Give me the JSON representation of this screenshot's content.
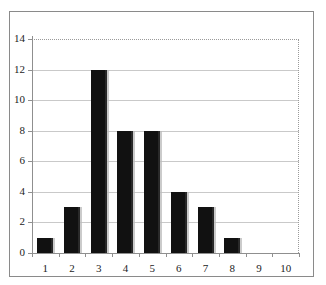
{
  "chart_data": {
    "type": "bar",
    "title": "",
    "subtitle": "",
    "xlabel": "",
    "ylabel": "",
    "categories": [
      "1",
      "2",
      "3",
      "4",
      "5",
      "6",
      "7",
      "8",
      "9",
      "10"
    ],
    "values": [
      1,
      3,
      12,
      8,
      8,
      4,
      3,
      1,
      0,
      0
    ],
    "ylim": [
      0,
      14
    ],
    "ytick_labels": [
      "0",
      "2",
      "4",
      "6",
      "8",
      "10",
      "12",
      "14"
    ],
    "ytick_values": [
      0,
      2,
      4,
      6,
      8,
      10,
      12,
      14
    ],
    "ystep": 2,
    "xtick_labels": [
      "1",
      "2",
      "3",
      "4",
      "5",
      "6",
      "7",
      "8",
      "9",
      "10"
    ],
    "grid": true,
    "grid_axis": "y",
    "legend": null,
    "legend_position": "none",
    "annotations": [],
    "series": [
      {
        "name": "frequency",
        "values": [
          1,
          3,
          12,
          8,
          8,
          4,
          3,
          1,
          0,
          0
        ]
      }
    ],
    "colors": {
      "bar_fill": "#111111",
      "bar_edge_shadow": "#b9b9b9",
      "gridline": "#c9c9c9",
      "axis_line": "#8f8f8f",
      "frame_border": "#8a8a8a",
      "plot_dotted_border": "#9a9a9a",
      "background": "#ffffff",
      "tick_label": "#1c1c1c"
    }
  }
}
